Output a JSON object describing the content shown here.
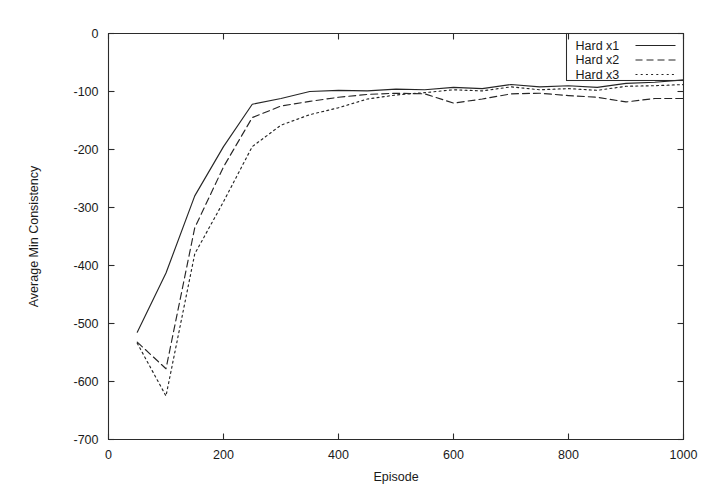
{
  "chart_data": {
    "type": "line",
    "title": "",
    "xlabel": "Episode",
    "ylabel": "Average Min Consistency",
    "xlim": [
      0,
      1000
    ],
    "ylim": [
      -700,
      0
    ],
    "xticks": [
      0,
      200,
      400,
      600,
      800,
      1000
    ],
    "yticks": [
      0,
      -100,
      -200,
      -300,
      -400,
      -500,
      -600,
      -700
    ],
    "xtick_labels": [
      "0",
      "200",
      "400",
      "600",
      "800",
      "1000"
    ],
    "ytick_labels": [
      "0",
      "-100",
      "-200",
      "-300",
      "-400",
      "-500",
      "-600",
      "-700"
    ],
    "grid": false,
    "legend_position": "top-right",
    "x": [
      50,
      100,
      150,
      200,
      250,
      300,
      350,
      400,
      450,
      500,
      550,
      600,
      650,
      700,
      750,
      800,
      850,
      900,
      950,
      1000
    ],
    "series": [
      {
        "name": "Hard x1",
        "dash": "solid",
        "values": [
          -515,
          -413,
          -280,
          -195,
          -122,
          -112,
          -100,
          -98,
          -99,
          -96,
          -97,
          -93,
          -95,
          -88,
          -92,
          -90,
          -93,
          -86,
          -84,
          -80
        ]
      },
      {
        "name": "Hard x2",
        "dash": "dashed",
        "values": [
          -532,
          -578,
          -335,
          -230,
          -145,
          -125,
          -117,
          -110,
          -105,
          -103,
          -104,
          -120,
          -113,
          -104,
          -103,
          -107,
          -110,
          -118,
          -112,
          -112
        ]
      },
      {
        "name": "Hard x3",
        "dash": "dotted",
        "values": [
          -534,
          -625,
          -380,
          -290,
          -195,
          -158,
          -140,
          -128,
          -113,
          -106,
          -102,
          -97,
          -99,
          -92,
          -97,
          -95,
          -98,
          -91,
          -90,
          -88
        ]
      }
    ]
  },
  "legend": {
    "entries": [
      {
        "label": "Hard x1"
      },
      {
        "label": "Hard x2"
      },
      {
        "label": "Hard x3"
      }
    ]
  }
}
